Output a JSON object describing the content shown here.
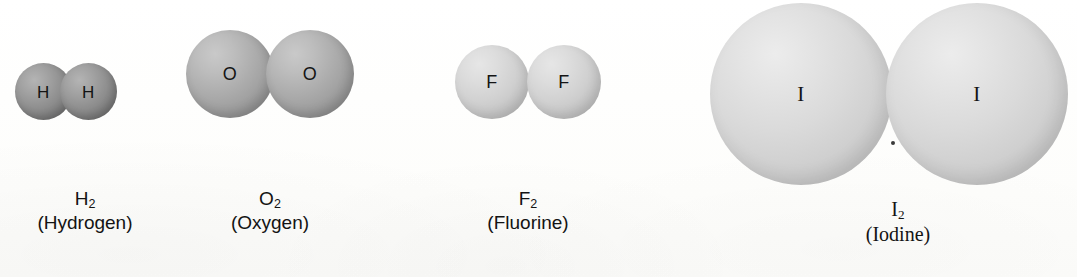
{
  "figure": {
    "type": "space-filling-molecular-models",
    "background_color": "#fdfdfc",
    "molecules": [
      {
        "id": "hydrogen",
        "formula_symbol": "H",
        "formula_subscript": "2",
        "name": "(Hydrogen)",
        "atom_symbol": "H",
        "atom_count": 2,
        "sphere_color": "#8e8e8e",
        "sphere_diameter_px": 57,
        "caption_font": "sans"
      },
      {
        "id": "oxygen",
        "formula_symbol": "O",
        "formula_subscript": "2",
        "name": "(Oxygen)",
        "atom_symbol": "O",
        "atom_count": 2,
        "sphere_color": "#ababab",
        "sphere_diameter_px": 88,
        "caption_font": "sans"
      },
      {
        "id": "fluorine",
        "formula_symbol": "F",
        "formula_subscript": "2",
        "name": "(Fluorine)",
        "atom_symbol": "F",
        "atom_count": 2,
        "sphere_color": "#d1d1d1",
        "sphere_diameter_px": 74,
        "caption_font": "sans"
      },
      {
        "id": "iodine",
        "formula_symbol": "I",
        "formula_subscript": "2",
        "name": "(Iodine)",
        "atom_symbol": "I",
        "atom_count": 2,
        "sphere_color": "#dadada",
        "sphere_diameter_px": 182,
        "caption_font": "serif"
      }
    ]
  }
}
